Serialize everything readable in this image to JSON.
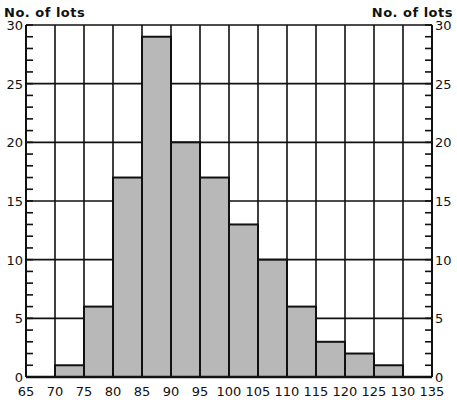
{
  "chart_data": {
    "type": "bar",
    "subtype": "histogram",
    "title": "",
    "xlabel": "",
    "ylabel": "No. of lots",
    "ylabel_right": "No. of lots",
    "bin_edges": [
      65,
      70,
      75,
      80,
      85,
      90,
      95,
      100,
      105,
      110,
      115,
      120,
      125,
      130,
      135
    ],
    "categories": [
      "65-70",
      "70-75",
      "75-80",
      "80-85",
      "85-90",
      "90-95",
      "95-100",
      "100-105",
      "105-110",
      "110-115",
      "115-120",
      "120-125",
      "125-130",
      "130-135"
    ],
    "values": [
      0,
      1,
      6,
      17,
      29,
      20,
      17,
      13,
      10,
      6,
      3,
      2,
      1,
      0
    ],
    "xlim": [
      65,
      135
    ],
    "ylim": [
      0,
      30
    ],
    "x_ticks": [
      "65",
      "70",
      "75",
      "80",
      "85",
      "90",
      "95",
      "100",
      "105",
      "110",
      "115",
      "120",
      "125",
      "130",
      "135"
    ],
    "y_ticks": [
      "0",
      "5",
      "10",
      "15",
      "20",
      "25",
      "30"
    ],
    "y_minor_tick_step": 1,
    "grid": true,
    "legend": null,
    "colors": {
      "bar_fill": "#b8b8b8",
      "bar_edge": "#111111",
      "grid": "#111111",
      "background": "#ffffff"
    }
  }
}
